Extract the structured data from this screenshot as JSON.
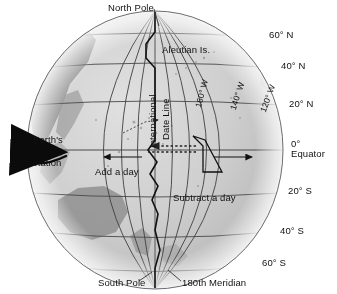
{
  "figure": {
    "kind": "earth-globe-diagram",
    "subject": "International Date Line",
    "background_color": "#ffffff",
    "globe_fill": "#c9c9c9",
    "line_color": "#3a3a3a",
    "text_color": "#111111"
  },
  "labels": {
    "north_pole": "North Pole",
    "south_pole": "South Pole",
    "meridian_180": "180th Meridian",
    "aleutian": "Aleutian Is.",
    "date_line_1": "International",
    "date_line_2": "Date Line",
    "earths": "Earth's",
    "rotation": "rotation",
    "add_a_day": "Add a day",
    "subtract_a_day": "Subtract a day",
    "equator_value": "0°",
    "equator_name": "Equator"
  },
  "latitudes": [
    {
      "label": "60° N",
      "value": 60,
      "hemisphere": "N"
    },
    {
      "label": "40° N",
      "value": 40,
      "hemisphere": "N"
    },
    {
      "label": "20° N",
      "value": 20,
      "hemisphere": "N"
    },
    {
      "label": "20° S",
      "value": -20,
      "hemisphere": "S"
    },
    {
      "label": "40° S",
      "value": -40,
      "hemisphere": "S"
    },
    {
      "label": "60° S",
      "value": -60,
      "hemisphere": "S"
    }
  ],
  "longitudes": [
    {
      "label": "160° W",
      "value": -160
    },
    {
      "label": "140° W",
      "value": -140
    },
    {
      "label": "120° W",
      "value": -120
    }
  ],
  "annotations": {
    "rotation_direction": "west-to-east",
    "west_of_line": "Add a day",
    "east_of_line": "Subtract a day"
  }
}
